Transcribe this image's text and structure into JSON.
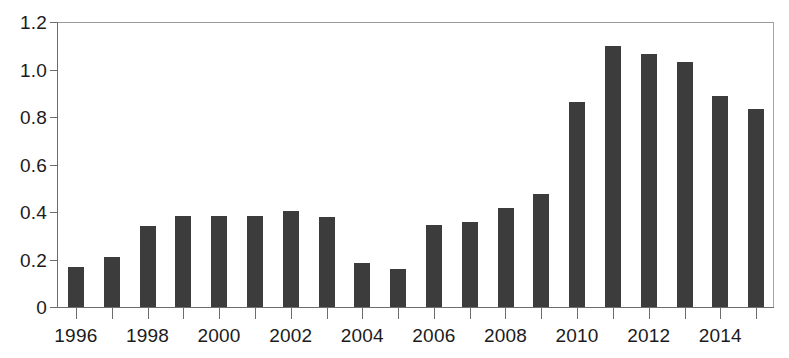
{
  "chart_data": {
    "type": "bar",
    "title": "",
    "subtitle": "",
    "xlabel": "",
    "ylabel": "",
    "categories": [
      "1996",
      "1997",
      "1998",
      "1999",
      "2000",
      "2001",
      "2002",
      "2003",
      "2004",
      "2005",
      "2006",
      "2007",
      "2008",
      "2009",
      "2010",
      "2011",
      "2012",
      "2013",
      "2014",
      "2015"
    ],
    "values": [
      0.17,
      0.21,
      0.34,
      0.385,
      0.385,
      0.385,
      0.405,
      0.38,
      0.185,
      0.16,
      0.345,
      0.36,
      0.415,
      0.475,
      0.865,
      1.1,
      1.065,
      1.03,
      0.89,
      0.835
    ],
    "ylim": [
      0,
      1.2
    ],
    "xlim_labels": [
      "1996",
      "2015"
    ],
    "ytick_labels": [
      "0",
      "0.2",
      "0.4",
      "0.6",
      "0.8",
      "1.0",
      "1.2"
    ],
    "ytick_values": [
      0,
      0.2,
      0.4,
      0.6,
      0.8,
      1.0,
      1.2
    ],
    "xtick_labels_shown": [
      "1996",
      "1998",
      "2000",
      "2002",
      "2004",
      "2006",
      "2008",
      "2010",
      "2012",
      "2014"
    ],
    "grid": false,
    "legend": null,
    "legend_position": "none",
    "bar_color": "#3c3c3c",
    "axis_color": "#6d6d6d",
    "frame_color": "#9a9a9a",
    "background": "#ffffff",
    "annotations": []
  }
}
